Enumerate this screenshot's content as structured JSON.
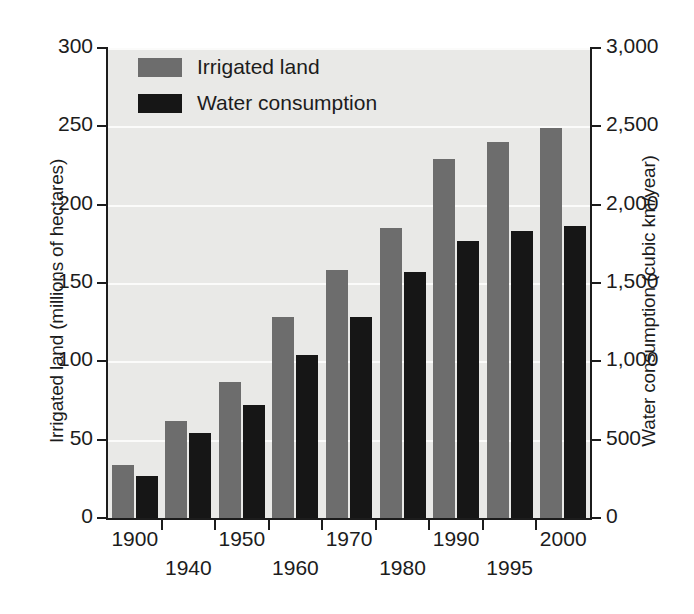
{
  "chart_data": {
    "type": "bar",
    "title": "",
    "xlabel": "",
    "ylabel": "Irrigated land (millions of hectares)",
    "y2label": "Water consumption (cubic km/year)",
    "categories": [
      "1900",
      "1940",
      "1950",
      "1960",
      "1970",
      "1980",
      "1990",
      "1995",
      "2000"
    ],
    "ylim": [
      0,
      300
    ],
    "yticks": [
      "0",
      "50",
      "100",
      "150",
      "200",
      "250",
      "300"
    ],
    "ytick_values": [
      0,
      50,
      100,
      150,
      200,
      250,
      300
    ],
    "y2lim": [
      0,
      3000
    ],
    "y2ticks": [
      "0",
      "500",
      "1,000",
      "1,500",
      "2,000",
      "2,500",
      "3,000"
    ],
    "y2tick_values": [
      0,
      500,
      1000,
      1500,
      2000,
      2500,
      3000
    ],
    "grid": true,
    "legend_position": "top-left",
    "series": [
      {
        "name": "Irrigated land",
        "color": "#6d6d6d",
        "axis": "left",
        "unit": "millions of hectares",
        "values": [
          34,
          62,
          87,
          128,
          158,
          185,
          229,
          240,
          249
        ]
      },
      {
        "name": "Water consumption",
        "color": "#161616",
        "axis": "right",
        "unit": "cubic km/year",
        "values": [
          270,
          540,
          720,
          1040,
          1280,
          1570,
          1770,
          1830,
          1865
        ]
      }
    ]
  },
  "legend": {
    "items": [
      {
        "label": "Irrigated land",
        "color": "#6d6d6d"
      },
      {
        "label": "Water consumption",
        "color": "#161616"
      }
    ]
  },
  "style": {
    "plot_background": "#e9e9e7",
    "gridline_color": "#fbfbfa",
    "axis_color": "#1c1c1c",
    "page_background": "#ffffff"
  }
}
